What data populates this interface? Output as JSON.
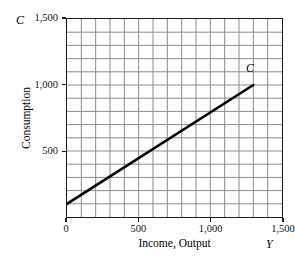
{
  "chart_data": {
    "type": "line",
    "title": "",
    "xlabel": "Income, Output",
    "ylabel": "Consumption",
    "x_symbol": "Y",
    "y_symbol": "C",
    "xlim": [
      0,
      1500
    ],
    "ylim": [
      0,
      1500
    ],
    "grid": true,
    "grid_step": 100,
    "grid_columns": 15,
    "grid_rows": 15,
    "legend": "none",
    "xticks": [
      0,
      500,
      1000,
      1500
    ],
    "xtick_labels": [
      "0",
      "500",
      "1,000",
      "1,500"
    ],
    "yticks": [
      500,
      1000,
      1500
    ],
    "ytick_labels": [
      "500",
      "1,000",
      "1,500"
    ],
    "series": [
      {
        "name": "C",
        "label": "C",
        "label_position": "end",
        "kind": "line",
        "color": "#000000",
        "linewidth": 2.6,
        "intercept": 100,
        "slope": 0.69,
        "x": [
          0,
          1300
        ],
        "values": [
          100,
          1000
        ],
        "points": [
          {
            "x": 0,
            "y": 100
          },
          {
            "x": 1300,
            "y": 1000
          }
        ]
      }
    ]
  },
  "style": {
    "background": "#ffffff",
    "axis_color": "#1a1a1a",
    "grid_color": "#8a8a8a",
    "line_color": "#000000",
    "text_color": "#111111"
  }
}
